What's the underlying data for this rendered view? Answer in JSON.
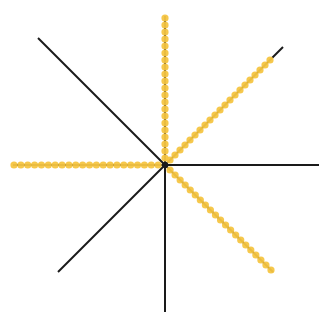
{
  "diagram": {
    "center": [
      165,
      165
    ],
    "line_color": "#1a1a1a",
    "dot_color": "#f5c542",
    "dot_radius": 3.6,
    "dot_spacing": 7,
    "lines": [
      {
        "name": "ray-up",
        "end": [
          165,
          16
        ],
        "dotted": true,
        "dot_end": [
          165,
          18
        ]
      },
      {
        "name": "ray-up-right",
        "end": [
          283,
          47
        ],
        "dotted": true,
        "dot_end": [
          270,
          60
        ]
      },
      {
        "name": "ray-right",
        "end": [
          319,
          165
        ],
        "dotted": false
      },
      {
        "name": "ray-down-right",
        "end": [
          273,
          272
        ],
        "dotted": true,
        "dot_end": [
          271,
          270
        ]
      },
      {
        "name": "ray-down",
        "end": [
          165,
          312
        ],
        "dotted": false
      },
      {
        "name": "ray-down-left",
        "end": [
          58,
          272
        ],
        "dotted": false
      },
      {
        "name": "ray-left",
        "end": [
          13,
          165
        ],
        "dotted": true,
        "dot_end": [
          14,
          165
        ]
      },
      {
        "name": "ray-up-left",
        "end": [
          38,
          38
        ],
        "dotted": false
      }
    ]
  }
}
